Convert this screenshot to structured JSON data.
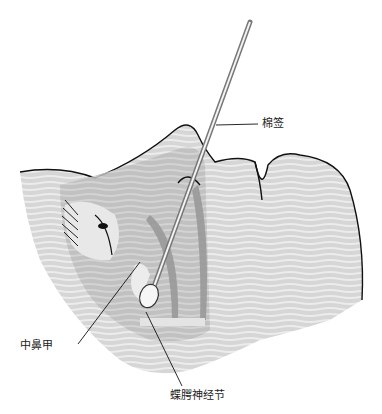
{
  "figure": {
    "labels": {
      "swab": "棉签",
      "middle_turbinate": "中鼻甲",
      "sphenopalatine_ganglion": "蝶腭神经节"
    },
    "colors": {
      "skin_light": "#dcdcdc",
      "skin_mid": "#c4c4c4",
      "skin_dark": "#a8a8a8",
      "outline": "#111111"
    }
  }
}
